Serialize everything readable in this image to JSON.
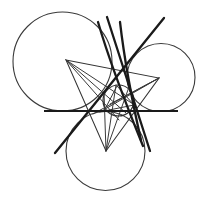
{
  "figure": {
    "type": "geometric-diagram",
    "canvas": {
      "width": 202,
      "height": 205,
      "background": "#ffffff"
    },
    "colors": {
      "circle_stroke": "#3a3a3a",
      "thin_line": "#3a3a3a",
      "thick_line": "#1a1a1a",
      "triangle_line": "#333333",
      "background": "#ffffff"
    },
    "circles": [
      {
        "name": "large-left-circle",
        "cx": 62.5,
        "cy": 61.5,
        "r": 49.5
      },
      {
        "name": "right-circle",
        "cx": 161.0,
        "cy": 77.5,
        "r": 34.0
      },
      {
        "name": "bottom-circle",
        "cx": 105.5,
        "cy": 151.0,
        "r": 39.5
      },
      {
        "name": "inner-small-circle",
        "cx": 118.5,
        "cy": 100.5,
        "r": 15.5
      }
    ],
    "triangle": {
      "name": "main-triangle",
      "vertices": [
        {
          "label": "A",
          "x": 66,
          "y": 60
        },
        {
          "label": "B",
          "x": 159,
          "y": 78
        },
        {
          "label": "C",
          "x": 106,
          "y": 151
        }
      ]
    },
    "inner_triangle": {
      "name": "contact-triangle",
      "vertices": [
        {
          "label": "P",
          "x": 104,
          "y": 111
        },
        {
          "label": "Q",
          "x": 134,
          "y": 105
        },
        {
          "label": "R",
          "x": 117,
          "y": 86
        }
      ]
    },
    "base_line": {
      "name": "common-tangent-line",
      "x1": 44,
      "y1": 111,
      "x2": 178,
      "y2": 111
    },
    "thick_lines": [
      {
        "name": "tangent-line-1",
        "x1": 107,
        "y1": 17,
        "x2": 150,
        "y2": 151
      },
      {
        "name": "tangent-line-2",
        "x1": 164,
        "y1": 18,
        "x2": 55,
        "y2": 153
      },
      {
        "name": "tangent-line-3",
        "x1": 122,
        "y1": 20,
        "x2": 143,
        "y2": 146
      },
      {
        "name": "tangent-arc-chord",
        "x1": 98,
        "y1": 22,
        "x2": 139,
        "y2": 143
      }
    ],
    "thin_lines": [
      {
        "name": "cevian-1",
        "x1": 66,
        "y1": 60,
        "x2": 134,
        "y2": 105
      },
      {
        "name": "cevian-2",
        "x1": 66,
        "y1": 60,
        "x2": 117,
        "y2": 118
      },
      {
        "name": "cevian-3",
        "x1": 159,
        "y1": 78,
        "x2": 104,
        "y2": 111
      },
      {
        "name": "cevian-4",
        "x1": 159,
        "y1": 78,
        "x2": 96,
        "y2": 113
      },
      {
        "name": "cevian-5",
        "x1": 106,
        "y1": 151,
        "x2": 117,
        "y2": 86
      },
      {
        "name": "cevian-6",
        "x1": 106,
        "y1": 151,
        "x2": 128,
        "y2": 88
      }
    ],
    "labels": []
  }
}
